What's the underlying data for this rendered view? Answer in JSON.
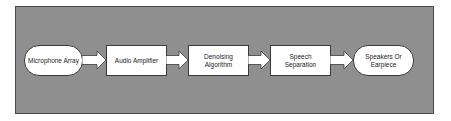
{
  "diagram": {
    "type": "flowchart",
    "direction": "left-to-right",
    "colors": {
      "panel_background": "#8f8f8f",
      "panel_border": "#4a4a4a",
      "node_fill": "#ffffff",
      "node_border": "#3a3a3a",
      "arrow_fill": "#ffffff",
      "text": "#222222"
    },
    "nodes": [
      {
        "id": "microphone-array",
        "shape": "terminal",
        "label": "Microphone Array"
      },
      {
        "id": "audio-amplifier",
        "shape": "process",
        "label": "Audio Amplifier"
      },
      {
        "id": "denoising-algorithm",
        "shape": "process",
        "label": "Denoising\nAlgorithm"
      },
      {
        "id": "speech-separation",
        "shape": "process",
        "label": "Speech\nSeparation"
      },
      {
        "id": "speakers-or-earpiece",
        "shape": "terminal",
        "label": "Speakers Or\nEarpiece"
      }
    ],
    "edges": [
      {
        "from": "microphone-array",
        "to": "audio-amplifier",
        "style": "block-arrow"
      },
      {
        "from": "audio-amplifier",
        "to": "denoising-algorithm",
        "style": "block-arrow"
      },
      {
        "from": "denoising-algorithm",
        "to": "speech-separation",
        "style": "block-arrow"
      },
      {
        "from": "speech-separation",
        "to": "speakers-or-earpiece",
        "style": "block-arrow"
      }
    ]
  }
}
